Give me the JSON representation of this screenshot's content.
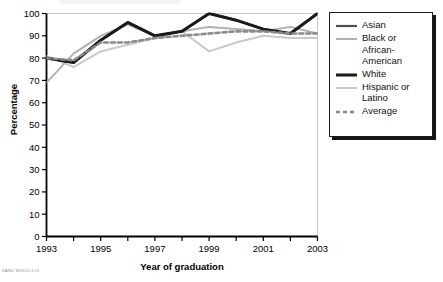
{
  "figure": {
    "footnote": "RAND MG515-3.11"
  },
  "legend": {
    "position": "right",
    "items": [
      {
        "label": "Asian",
        "color": "#4d4d4d",
        "width": 2.2,
        "dash": "none",
        "swatch_name": "legend-swatch-asian"
      },
      {
        "label": "Black or\nAfrican-\nAmerican",
        "color": "#b0b0b0",
        "width": 2.0,
        "dash": "none",
        "swatch_name": "legend-swatch-black-or-african-american"
      },
      {
        "label": "White",
        "color": "#1a1a1a",
        "width": 3.0,
        "dash": "none",
        "swatch_name": "legend-swatch-white"
      },
      {
        "label": "Hispanic or\nLatino",
        "color": "#c9c9c9",
        "width": 2.0,
        "dash": "none",
        "swatch_name": "legend-swatch-hispanic-or-latino"
      },
      {
        "label": "Average",
        "color": "#8a8a8a",
        "width": 2.6,
        "dash": "4,3",
        "swatch_name": "legend-swatch-average"
      }
    ]
  },
  "chart_data": {
    "type": "line",
    "title": "",
    "xlabel": "Year of graduation",
    "ylabel": "Percentage",
    "xlim": [
      1993,
      2003
    ],
    "ylim": [
      0,
      100
    ],
    "ytick_step": 10,
    "grid": false,
    "x": [
      1993,
      1994,
      1995,
      1996,
      1997,
      1998,
      1999,
      2000,
      2001,
      2002,
      2003
    ],
    "xticks": [
      1993,
      1994,
      1995,
      1996,
      1997,
      1998,
      1999,
      2000,
      2001,
      2002,
      2003
    ],
    "xtick_labels": [
      "1993",
      "",
      "1995",
      "",
      "1997",
      "",
      "1999",
      "",
      "2001",
      "",
      "2003"
    ],
    "yticks": [
      0,
      10,
      20,
      30,
      40,
      50,
      60,
      70,
      80,
      90,
      100
    ],
    "ytick_labels": [
      "0",
      "10",
      "20",
      "30",
      "40",
      "50",
      "60",
      "70",
      "80",
      "90",
      "100"
    ],
    "legend_position": "right",
    "series": [
      {
        "name": "Asian",
        "color": "#4d4d4d",
        "width": 2.2,
        "dash": "none",
        "values": [
          80,
          78,
          88,
          96,
          90,
          92,
          100,
          97,
          93,
          91,
          100
        ]
      },
      {
        "name": "Black or African-American",
        "color": "#b0b0b0",
        "width": 2.0,
        "dash": "none",
        "values": [
          69,
          82,
          90,
          95,
          90,
          92,
          94,
          93,
          92,
          94,
          91
        ]
      },
      {
        "name": "White",
        "color": "#1a1a1a",
        "width": 3.0,
        "dash": "none",
        "values": [
          80,
          78,
          88,
          96,
          90,
          92,
          100,
          97,
          93,
          91,
          100
        ]
      },
      {
        "name": "Hispanic or Latino",
        "color": "#c9c9c9",
        "width": 2.0,
        "dash": "none",
        "values": [
          81,
          76,
          83,
          86,
          89,
          92,
          83,
          87,
          90,
          89,
          89
        ]
      },
      {
        "name": "Average",
        "color": "#8a8a8a",
        "width": 2.6,
        "dash": "4,3",
        "values": [
          80,
          79,
          87,
          87,
          89,
          90,
          91,
          92,
          92,
          91,
          91
        ]
      }
    ]
  }
}
